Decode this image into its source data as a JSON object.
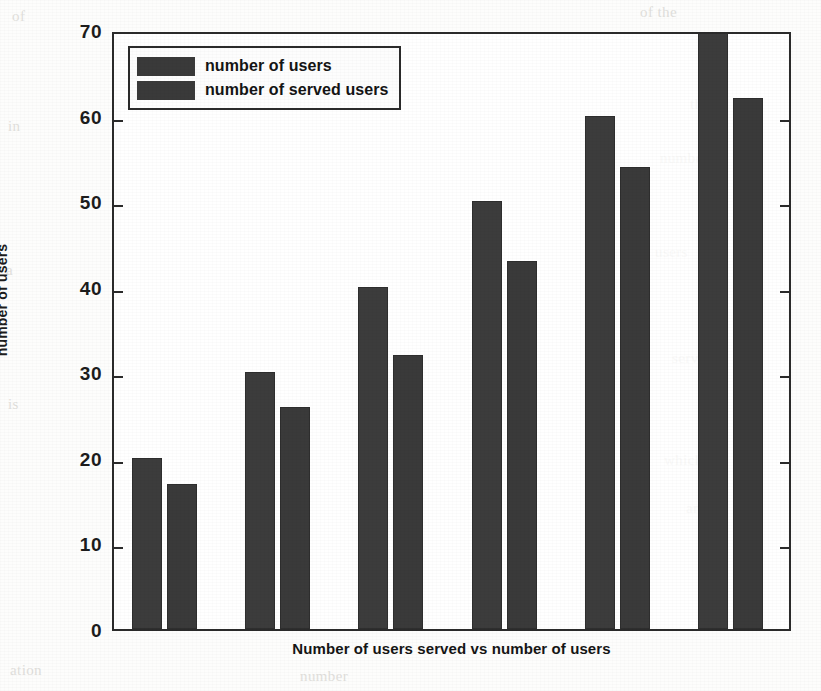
{
  "chart_data": {
    "type": "bar",
    "title": "",
    "xlabel": "Number of users served vs number of users",
    "ylabel": "number of users",
    "ylim": [
      0,
      70
    ],
    "yticks": [
      0,
      10,
      20,
      30,
      40,
      50,
      60,
      70
    ],
    "ytick_labels": [
      "0",
      "10",
      "20",
      "30",
      "40",
      "50",
      "60",
      "70"
    ],
    "xticks": [],
    "xtick_labels": [],
    "grid": false,
    "legend_position": "upper left",
    "categories": [
      "1",
      "2",
      "3",
      "4",
      "5",
      "6"
    ],
    "series": [
      {
        "name": "number of users",
        "color": "#3c3c3c",
        "values": [
          20,
          30,
          40,
          50,
          60,
          70
        ]
      },
      {
        "name": "number of served users",
        "color": "#3a3a3a",
        "values": [
          17,
          26,
          32,
          43,
          54,
          62
        ]
      }
    ]
  },
  "legend": {
    "items": [
      {
        "label": "number of users"
      },
      {
        "label": "number of served users"
      }
    ]
  },
  "axes": {
    "y_label": "number of users",
    "x_label": "Number of users served vs number of users",
    "y_tick_labels": [
      "70",
      "60",
      "50",
      "40",
      "30",
      "20",
      "10",
      "0"
    ]
  },
  "background_text": [
    "Number of users",
    "number of users",
    "users",
    "served",
    "number"
  ]
}
